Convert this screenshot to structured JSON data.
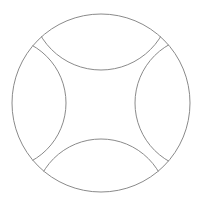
{
  "diagram": {
    "stroke_color": "#8a8a8a",
    "background": "#ffffff",
    "outer_circle": {
      "cx": 101,
      "cy": 103,
      "r": 89
    },
    "arcs": [
      {
        "name": "top-arc",
        "cx": 101,
        "cy": 0,
        "r": 70
      },
      {
        "name": "bottom-arc",
        "cx": 101,
        "cy": 206,
        "r": 67
      },
      {
        "name": "left-arc",
        "cx": 0,
        "cy": 103,
        "r": 66
      },
      {
        "name": "right-arc",
        "cx": 202,
        "cy": 103,
        "r": 67
      }
    ]
  }
}
